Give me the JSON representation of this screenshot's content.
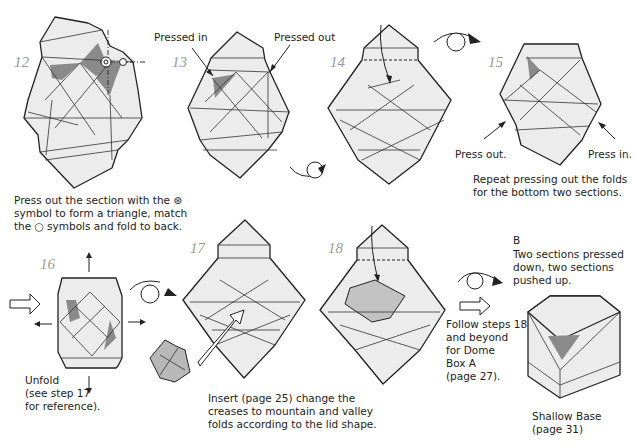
{
  "steps": [
    {
      "id": "12",
      "number": "12"
    },
    {
      "id": "13",
      "number": "13",
      "callouts": [
        "Pressed in",
        "Pressed out"
      ]
    },
    {
      "id": "14",
      "number": "14"
    },
    {
      "id": "15",
      "number": "15",
      "callouts": [
        "Press out.",
        "Press in."
      ],
      "caption": [
        "Repeat pressing out the folds",
        "for the bottom two sections."
      ]
    },
    {
      "id": "16",
      "number": "16",
      "caption": [
        "Unfold",
        "(see step 17",
        "for reference)."
      ]
    },
    {
      "id": "17",
      "number": "17",
      "caption": [
        "Insert (page 25) change the",
        "creases to mountain and valley",
        "folds according to the lid shape."
      ]
    },
    {
      "id": "18",
      "number": "18"
    }
  ],
  "step12_caption": [
    "Press out the section with the ⊛",
    "symbol to form a triangle, match",
    "the ○ symbols and fold to back."
  ],
  "variant_b": {
    "label": "B",
    "description": [
      "Two sections pressed",
      "down, two sections",
      "pushed up."
    ],
    "follow": [
      "Follow steps 18",
      "and beyond",
      "for Dome",
      "Box A",
      "(page 27)."
    ],
    "result": [
      "Shallow Base",
      "(page 31)"
    ]
  },
  "icons": [
    "turn-over-icon",
    "push-arrow-icon",
    "pull-arrow-icon",
    "insert-arrow-icon"
  ]
}
